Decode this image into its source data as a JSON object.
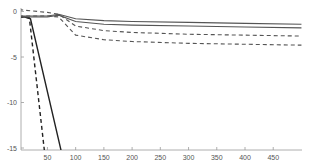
{
  "chart_data": {
    "type": "line",
    "title": "",
    "xlabel": "",
    "ylabel": "",
    "xlim": [
      0,
      500
    ],
    "ylim": [
      -15,
      0.3
    ],
    "grid": false,
    "legend": null,
    "x_ticks": [
      50,
      100,
      150,
      200,
      250,
      300,
      350,
      400,
      450
    ],
    "y_ticks": [
      0,
      -5,
      -10,
      -15
    ],
    "series": [
      {
        "name": "solid-steep",
        "style": "solid",
        "color": "#222222",
        "x": [
          0,
          10,
          20,
          75
        ],
        "y": [
          -0.6,
          -0.6,
          -0.8,
          -15.5
        ]
      },
      {
        "name": "dashed-steep",
        "style": "dashed",
        "color": "#222222",
        "x": [
          0,
          10,
          18,
          45
        ],
        "y": [
          -0.6,
          -0.6,
          -0.7,
          -15.5
        ]
      },
      {
        "name": "solid-upper",
        "style": "solid",
        "color": "#555555",
        "x": [
          0,
          50,
          70,
          100,
          150,
          200,
          300,
          400,
          500
        ],
        "y": [
          -0.5,
          -0.5,
          -0.3,
          -0.8,
          -1.0,
          -1.1,
          -1.2,
          -1.3,
          -1.4
        ]
      },
      {
        "name": "solid-lower",
        "style": "solid",
        "color": "#555555",
        "x": [
          0,
          50,
          70,
          100,
          150,
          200,
          300,
          400,
          500
        ],
        "y": [
          -0.6,
          -0.6,
          -0.4,
          -1.1,
          -1.4,
          -1.5,
          -1.6,
          -1.7,
          -1.8
        ]
      },
      {
        "name": "dashed-upper",
        "style": "dashed",
        "color": "#555555",
        "x": [
          0,
          50,
          70,
          100,
          150,
          200,
          300,
          400,
          500
        ],
        "y": [
          0.2,
          -0.1,
          -0.3,
          -1.6,
          -2.1,
          -2.3,
          -2.5,
          -2.6,
          -2.7
        ]
      },
      {
        "name": "dashed-lower",
        "style": "dashed",
        "color": "#555555",
        "x": [
          0,
          50,
          70,
          100,
          150,
          200,
          300,
          400,
          500
        ],
        "y": [
          -0.5,
          -0.5,
          -0.6,
          -2.6,
          -3.1,
          -3.3,
          -3.5,
          -3.6,
          -3.7
        ]
      }
    ]
  }
}
